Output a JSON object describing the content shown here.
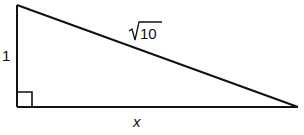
{
  "diagram": {
    "type": "right-triangle",
    "labels": {
      "vertical_leg": "1",
      "hypotenuse_radicand": "10",
      "horizontal_leg": "x"
    },
    "right_angle_marker": true,
    "colors": {
      "stroke": "#111111",
      "background": "#ffffff"
    }
  }
}
